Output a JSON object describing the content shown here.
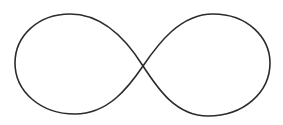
{
  "figure": {
    "label": "Infinity symbol",
    "background": "#ffffff",
    "stroke_color": "#2b2b2b",
    "stroke_width": 1.6
  }
}
